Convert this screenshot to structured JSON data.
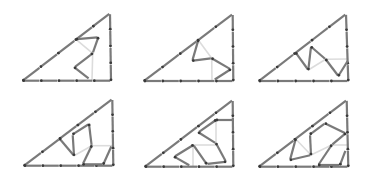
{
  "diagram": {
    "colors": {
      "stick": "#7a7a7a",
      "head": "#3a3a3a",
      "faint": "#dcdcdc",
      "background": "#ffffff"
    },
    "panels": [
      {
        "id": 1,
        "triangle": [
          [
            22.7,
            80.7
          ],
          [
            110,
            13.3
          ],
          [
            111,
            80.7
          ]
        ],
        "hyp_segments": 5,
        "bottom_segments": 5,
        "right_segments": 4,
        "sticks": [
          [
            [
              76,
              39.3
            ],
            [
              98.3,
              37.3
            ]
          ],
          [
            [
              98.3,
              37.3
            ],
            [
              92.7,
              53.3
            ]
          ],
          [
            [
              92.7,
              53.3
            ],
            [
              74.3,
              67.3
            ]
          ],
          [
            [
              74.3,
              67.3
            ],
            [
              89.3,
              79
            ]
          ]
        ],
        "faint": [
          [
            [
              76,
              39.3
            ],
            [
              92.7,
              53.3
            ]
          ],
          [
            [
              92.7,
              53.3
            ],
            [
              92,
              80
            ]
          ]
        ]
      },
      {
        "id": 2,
        "triangle": [
          [
            144,
            81
          ],
          [
            232.7,
            14
          ],
          [
            233.3,
            81
          ]
        ],
        "hyp_segments": 5,
        "bottom_segments": 5,
        "right_segments": 4,
        "sticks": [
          [
            [
              198.3,
              40
            ],
            [
              192.3,
              60.7
            ]
          ],
          [
            [
              192.3,
              60.7
            ],
            [
              211.7,
              58.3
            ]
          ],
          [
            [
              211.7,
              58.3
            ],
            [
              230.7,
              69.3
            ]
          ],
          [
            [
              230.7,
              69.3
            ],
            [
              214,
              80
            ]
          ]
        ],
        "faint": [
          [
            [
              198.3,
              40
            ],
            [
              211.7,
              58.3
            ]
          ],
          [
            [
              211.7,
              58.3
            ],
            [
              212,
              81
            ]
          ]
        ]
      },
      {
        "id": 3,
        "triangle": [
          [
            259,
            81
          ],
          [
            346,
            14
          ],
          [
            348.3,
            81
          ]
        ],
        "hyp_segments": 5,
        "bottom_segments": 5,
        "right_segments": 4,
        "sticks": [
          [
            [
              295.7,
              52.7
            ],
            [
              308.3,
              70
            ]
          ],
          [
            [
              308.3,
              70
            ],
            [
              311,
              46.7
            ]
          ],
          [
            [
              311,
              46.7
            ],
            [
              325.7,
              59.3
            ]
          ],
          [
            [
              325.7,
              59.3
            ],
            [
              338.3,
              76
            ]
          ],
          [
            [
              338.3,
              76
            ],
            [
              348.3,
              60
            ]
          ]
        ],
        "faint": [
          [
            [
              308.3,
              70
            ],
            [
              325.7,
              59.3
            ]
          ],
          [
            [
              325.7,
              59.3
            ],
            [
              348.3,
              59
            ]
          ]
        ]
      },
      {
        "id": 4,
        "triangle": [
          [
            24,
            165.7
          ],
          [
            112.3,
            99
          ],
          [
            113.3,
            165.7
          ]
        ],
        "hyp_segments": 5,
        "bottom_segments": 5,
        "right_segments": 4,
        "sticks": [
          [
            [
              59.3,
              138.3
            ],
            [
              74,
              155.7
            ]
          ],
          [
            [
              74,
              155.7
            ],
            [
              72.7,
              134.3
            ]
          ],
          [
            [
              72.7,
              134.3
            ],
            [
              89,
              124
            ]
          ],
          [
            [
              89,
              124
            ],
            [
              91.7,
              145.7
            ]
          ],
          [
            [
              91.7,
              145.7
            ],
            [
              82.7,
              164.3
            ]
          ],
          [
            [
              82.7,
              164.3
            ],
            [
              103.3,
              164.3
            ]
          ],
          [
            [
              103.3,
              164.3
            ],
            [
              111.7,
              145.7
            ]
          ]
        ],
        "faint": [
          [
            [
              74,
              155.7
            ],
            [
              91.7,
              145.7
            ]
          ],
          [
            [
              91.7,
              145.7
            ],
            [
              113,
              145.7
            ]
          ]
        ]
      },
      {
        "id": 5,
        "triangle": [
          [
            145,
            166.7
          ],
          [
            232.7,
            100
          ],
          [
            233.3,
            166.7
          ]
        ],
        "hyp_segments": 5,
        "bottom_segments": 5,
        "right_segments": 4,
        "sticks": [
          [
            [
              216,
              120
            ],
            [
              233.3,
              120
            ]
          ],
          [
            [
              216,
              120
            ],
            [
              198.3,
              132.3
            ]
          ],
          [
            [
              198.3,
              132.3
            ],
            [
              216,
              143.3
            ]
          ],
          [
            [
              216,
              143.3
            ],
            [
              226,
              161.7
            ]
          ],
          [
            [
              226,
              161.7
            ],
            [
              206.7,
              164
            ]
          ],
          [
            [
              206.7,
              164
            ],
            [
              193.3,
              145
            ]
          ],
          [
            [
              193.3,
              145
            ],
            [
              174.3,
              156.7
            ]
          ],
          [
            [
              174.3,
              156.7
            ],
            [
              190,
              165.7
            ]
          ]
        ],
        "faint": [
          [
            [
              216,
              120
            ],
            [
              216,
              143.3
            ]
          ],
          [
            [
              193,
              145
            ],
            [
              216,
              145
            ]
          ],
          [
            [
              193,
              145
            ],
            [
              193,
              166.7
            ]
          ]
        ]
      },
      {
        "id": 6,
        "triangle": [
          [
            259,
            166.7
          ],
          [
            346.7,
            100
          ],
          [
            348.3,
            166.7
          ]
        ],
        "hyp_segments": 5,
        "bottom_segments": 5,
        "right_segments": 4,
        "sticks": [
          [
            [
              295.7,
              139
            ],
            [
              290,
              160
            ]
          ],
          [
            [
              290,
              160
            ],
            [
              311,
              155
            ]
          ],
          [
            [
              311,
              155
            ],
            [
              310,
              134.3
            ]
          ],
          [
            [
              310,
              134.3
            ],
            [
              325,
              123.3
            ]
          ],
          [
            [
              325,
              123.3
            ],
            [
              345.7,
              133.3
            ]
          ],
          [
            [
              345.7,
              133.3
            ],
            [
              331.7,
              145
            ]
          ],
          [
            [
              331.7,
              145
            ],
            [
              318.3,
              165
            ]
          ],
          [
            [
              318.3,
              165
            ],
            [
              340,
              165
            ]
          ],
          [
            [
              340,
              165
            ],
            [
              345.7,
              150
            ]
          ]
        ],
        "faint": [
          [
            [
              295.7,
              139
            ],
            [
              311,
              155
            ]
          ],
          [
            [
              311,
              155
            ],
            [
              331.7,
              145
            ]
          ],
          [
            [
              331.7,
              145
            ],
            [
              348,
              145
            ]
          ]
        ]
      }
    ]
  }
}
